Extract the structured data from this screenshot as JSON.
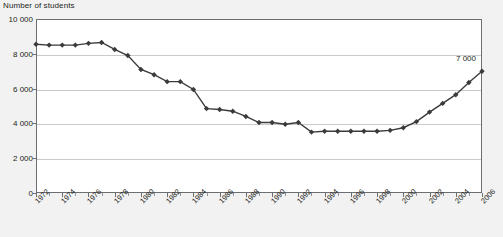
{
  "chart_title": "Number of students",
  "annotation": {
    "text": "7 000",
    "year": 2006,
    "value": 7000
  },
  "axes": {
    "y": {
      "label": "",
      "min": 0,
      "max": 10000,
      "ticks": [
        0,
        2000,
        4000,
        6000,
        8000,
        10000
      ],
      "tick_labels": [
        "0",
        "2 000",
        "4 000",
        "6 000",
        "8 000",
        "10 000"
      ],
      "gridlines": [
        2000,
        4000,
        6000,
        8000
      ]
    },
    "x": {
      "label": "",
      "min": 1972,
      "max": 2006,
      "tick_labels": [
        "1972",
        "1974",
        "1976",
        "1978",
        "1980",
        "1982",
        "1984",
        "1986",
        "1988",
        "1990",
        "1992",
        "1994",
        "1996",
        "1998",
        "2000",
        "2002",
        "2004",
        "2006"
      ],
      "tick_label_years": [
        1972,
        1974,
        1976,
        1978,
        1980,
        1982,
        1984,
        1986,
        1988,
        1990,
        1992,
        1994,
        1996,
        1998,
        2000,
        2002,
        2004,
        2006
      ],
      "label_rotation_deg": -45
    }
  },
  "colors": {
    "page_background": "#f2f2f2",
    "plot_background": "#ffffff",
    "frame": "#6d6e71",
    "gridline": "#c9cacc",
    "series_line": "#3b3b3d",
    "marker": "#3b3b3d",
    "text": "#231f20"
  },
  "chart_data": {
    "type": "line",
    "title": "Number of students",
    "xlabel": "",
    "ylabel": "Number of students",
    "ylim": [
      0,
      10000
    ],
    "xlim": [
      1972,
      2006
    ],
    "grid": true,
    "legend": "none",
    "marker": "diamond",
    "annotations": [
      {
        "text": "7 000",
        "x": 2006,
        "y": 7000
      }
    ],
    "x": [
      1972,
      1973,
      1974,
      1975,
      1976,
      1977,
      1978,
      1979,
      1980,
      1981,
      1982,
      1983,
      1984,
      1985,
      1986,
      1987,
      1988,
      1989,
      1990,
      1991,
      1992,
      1993,
      1994,
      1995,
      1996,
      1997,
      1998,
      1999,
      2000,
      2001,
      2002,
      2003,
      2004,
      2005,
      2006
    ],
    "categories": [
      "1972",
      "1973",
      "1974",
      "1975",
      "1976",
      "1977",
      "1978",
      "1979",
      "1980",
      "1981",
      "1982",
      "1983",
      "1984",
      "1985",
      "1986",
      "1987",
      "1988",
      "1989",
      "1990",
      "1991",
      "1992",
      "1993",
      "1994",
      "1995",
      "1996",
      "1997",
      "1998",
      "1999",
      "2000",
      "2001",
      "2002",
      "2003",
      "2004",
      "2005",
      "2006"
    ],
    "values": [
      8550,
      8500,
      8500,
      8500,
      8600,
      8650,
      8250,
      7900,
      7100,
      6800,
      6400,
      6400,
      5950,
      4850,
      4800,
      4700,
      4400,
      4050,
      4050,
      3950,
      4050,
      3500,
      3550,
      3550,
      3550,
      3550,
      3550,
      3600,
      3750,
      4100,
      4650,
      5150,
      5650,
      6350,
      7000
    ],
    "series": [
      {
        "name": "Number of students",
        "values": [
          8550,
          8500,
          8500,
          8500,
          8600,
          8650,
          8250,
          7900,
          7100,
          6800,
          6400,
          6400,
          5950,
          4850,
          4800,
          4700,
          4400,
          4050,
          4050,
          3950,
          4050,
          3500,
          3550,
          3550,
          3550,
          3550,
          3550,
          3600,
          3750,
          4100,
          4650,
          5150,
          5650,
          6350,
          7000
        ]
      }
    ]
  }
}
